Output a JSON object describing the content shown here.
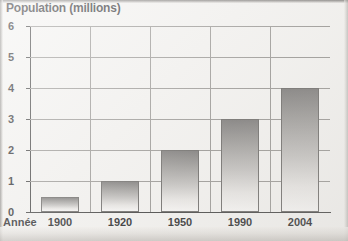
{
  "chart_data": {
    "type": "bar",
    "title": "Population (millions)",
    "xlabel": "Année",
    "ylabel": "Population (millions)",
    "categories": [
      "1900",
      "1920",
      "1950",
      "1990",
      "2004"
    ],
    "values": [
      0.5,
      1,
      2,
      3,
      4
    ],
    "ylim": [
      0,
      6
    ],
    "y_ticks": [
      "0",
      "1",
      "2",
      "3",
      "4",
      "5",
      "6"
    ],
    "grid": true,
    "legend": "none",
    "bar_fill": "#8e8c8a",
    "bar_edge": "#5b5957",
    "gridline_color": "#8d8b88",
    "axis_color": "#2b2b2b",
    "background": "#f2f1ef"
  },
  "labels": {
    "title": "Population (millions)",
    "x_axis_title": "Année"
  }
}
